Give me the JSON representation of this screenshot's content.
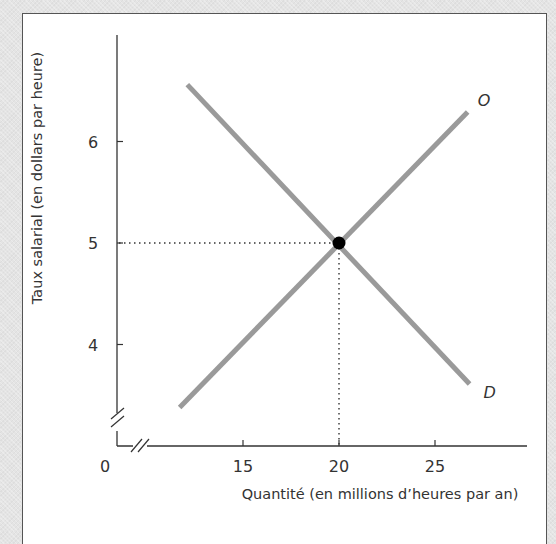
{
  "chart_data": {
    "type": "line",
    "title": "",
    "xlabel": "Quantité (en millions d’heures par an)",
    "ylabel": "Taux salarial (en dollars par heure)",
    "x_ticks": [
      15,
      20,
      25
    ],
    "y_ticks": [
      4,
      5,
      6
    ],
    "origin_label": "0",
    "xlim": [
      11,
      29.9
    ],
    "ylim": [
      3,
      6.99
    ],
    "axis_breaks": {
      "x": true,
      "y": true
    },
    "grid": false,
    "series": [
      {
        "name": "O",
        "label": "O",
        "color": "#9a9a9a",
        "points": [
          [
            11.7,
            3.38
          ],
          [
            26.7,
            6.29
          ]
        ]
      },
      {
        "name": "D",
        "label": "D",
        "color": "#9a9a9a",
        "points": [
          [
            12.1,
            6.56
          ],
          [
            26.8,
            3.61
          ]
        ]
      }
    ],
    "equilibrium": {
      "x": 20,
      "y": 5,
      "color": "#000000"
    },
    "reference_lines": {
      "style": "dotted",
      "to_x": 20,
      "to_y": 5
    }
  }
}
